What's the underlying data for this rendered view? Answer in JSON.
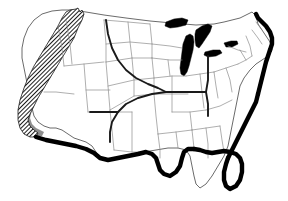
{
  "figure": {
    "name": "contiguous-united-states-thematic-map",
    "width": 288,
    "height": 201,
    "background_color": "#ffffff",
    "title": "",
    "caption": "",
    "has_legend": false,
    "has_axis_labels": false,
    "has_visible_text": false
  },
  "map_data": {
    "type": "choropleth-outline",
    "region": "Contiguous United States",
    "projection_appearance": "equal-area conic",
    "layers": [
      {
        "id": "nation-outline",
        "label": "National boundary",
        "stroke_color": "#5a5a5a",
        "fill_color": "#ffffff",
        "stroke_width": 0.9
      },
      {
        "id": "state-borders",
        "label": "State boundaries",
        "stroke_color": "#8d8d8d",
        "fill_color": "none",
        "stroke_width": 0.7
      },
      {
        "id": "coast-heavy",
        "label": "Gulf, Atlantic and Mexican border emphasis",
        "stroke_color": "#000000",
        "fill_color": "none",
        "stroke_width": 4.4
      },
      {
        "id": "great-lakes",
        "label": "Lake Michigan and Great Lakes fill",
        "stroke_color": "#000000",
        "fill_color": "#000000",
        "stroke_width": 0.5
      },
      {
        "id": "contour-line",
        "label": "Interior boundary contour",
        "stroke_color": "#1a1a1a",
        "fill_color": "none",
        "stroke_width": 1.9
      },
      {
        "id": "buffer-band",
        "label": "Gray transition band east of hatched zone",
        "stroke_color": "none",
        "fill_color": "#8f8f8f",
        "stroke_width": 0
      },
      {
        "id": "hatch-zone",
        "label": "Diagonally hatched West Coast zone",
        "stroke_color": "#1a1a1a",
        "fill_color": "diagonal-hatch",
        "stroke_width": 0.8
      }
    ],
    "shaded_regions": [
      {
        "id": "west-coast-hatch",
        "label": "West Coast hatched region",
        "pattern": "diagonal-hatch",
        "pattern_angle_degrees": 45,
        "pattern_color": "#111111",
        "extent": "Pacific coast from northern Washington south through California to the Mexican border"
      },
      {
        "id": "west-coast-buffer",
        "label": "Gray buffer band",
        "pattern": "solid",
        "pattern_color": "#8f8f8f",
        "extent": "Narrow band immediately east of the hatched Pacific zone"
      }
    ],
    "emphasized_coastlines": [
      "Gulf of Mexico coast",
      "Florida peninsula",
      "South Atlantic coast",
      "Mid-Atlantic coast",
      "New England coast",
      "United States - Mexico border"
    ],
    "filled_water_bodies": [
      "Lake Michigan",
      "Lake Huron",
      "Lake Superior edge",
      "Lake Erie edge",
      "Lake Ontario edge"
    ],
    "values": [],
    "annotations": []
  }
}
